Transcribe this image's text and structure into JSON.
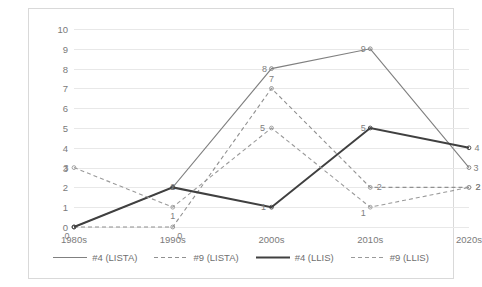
{
  "chart_data": {
    "type": "line",
    "title": "",
    "xlabel": "",
    "ylabel": "",
    "categories": [
      "1980s",
      "1990s",
      "2000s",
      "2010s",
      "2020s"
    ],
    "ylim": [
      0,
      10
    ],
    "yticks": [
      0,
      1,
      2,
      3,
      4,
      5,
      6,
      7,
      8,
      9,
      10
    ],
    "grid": true,
    "legend_position": "bottom",
    "data_labels": true,
    "series": [
      {
        "name": "#4 (LISTA)",
        "values": [
          0,
          2,
          8,
          9,
          3
        ],
        "style": "solid",
        "color": "#808080",
        "width": 1.1,
        "marker": "circle"
      },
      {
        "name": "#9 (LISTA)",
        "values": [
          0,
          0,
          7,
          2,
          2
        ],
        "style": "dashed",
        "color": "#909090",
        "width": 1.1,
        "marker": "circle"
      },
      {
        "name": "#4 (LLIS)",
        "values": [
          0,
          2,
          1,
          5,
          4
        ],
        "style": "solid",
        "color": "#404040",
        "width": 2.0,
        "marker": "circle"
      },
      {
        "name": "#9 (LLIS)",
        "values": [
          3,
          1,
          5,
          1,
          2
        ],
        "style": "dashed",
        "color": "#9a9a9a",
        "width": 1.1,
        "marker": "circle"
      }
    ]
  },
  "colors": {
    "grid": "#e8e8e8",
    "border": "#d9d9d9",
    "tick_text": "#7a7a7a",
    "label_text": "#808080",
    "legend_text": "#6f6f6f"
  }
}
